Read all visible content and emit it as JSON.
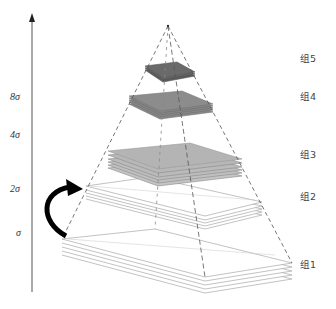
{
  "diagram": {
    "type": "scale-space pyramid",
    "axis": {
      "direction": "up",
      "labels": [
        {
          "text": "8σ",
          "key": "8",
          "y": 100
        },
        {
          "text": "4σ",
          "key": "4",
          "y": 138
        },
        {
          "text": "2σ",
          "key": "2",
          "y": 192
        },
        {
          "text": "σ",
          "key": "1",
          "y": 236
        }
      ]
    },
    "groups": [
      {
        "label": "组5",
        "y": 62
      },
      {
        "label": "组4",
        "y": 100
      },
      {
        "label": "组3",
        "y": 158
      },
      {
        "label": "组2",
        "y": 200
      },
      {
        "label": "组1",
        "y": 268
      }
    ],
    "colors": {
      "axis": "#555555",
      "dashed": "#555555",
      "group5": "#6a6a6a",
      "group4": "#8c8c8c",
      "group3": "#b8b8b8",
      "group2": "#ffffff",
      "group1": "#ffffff",
      "stack_edge": "#999999",
      "curved_arrow": "#000000"
    }
  }
}
